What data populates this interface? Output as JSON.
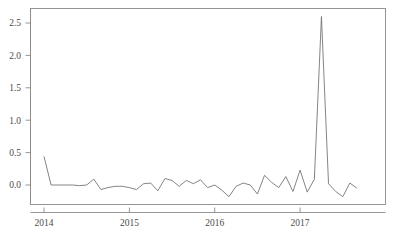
{
  "chart_data": {
    "type": "line",
    "title": "",
    "subtitle": "",
    "xlabel": "",
    "ylabel": "",
    "grid": false,
    "legend": null,
    "xlim": [
      2014.0,
      2017.75
    ],
    "ylim": [
      -0.32,
      2.72
    ],
    "x_ticks": [
      2014,
      2015,
      2016,
      2017
    ],
    "x_tick_labels": [
      "2014",
      "2015",
      "2016",
      "2017"
    ],
    "y_ticks": [
      0.0,
      0.5,
      1.0,
      1.5,
      2.0,
      2.5
    ],
    "y_tick_labels": [
      "0.0",
      "0.5",
      "1.0",
      "1.5",
      "2.0",
      "2.5"
    ],
    "series": [
      {
        "name": "series-1",
        "color": "#6e6e6e",
        "x": [
          2014.0,
          2014.083,
          2014.167,
          2014.25,
          2014.333,
          2014.417,
          2014.5,
          2014.583,
          2014.667,
          2014.75,
          2014.833,
          2014.917,
          2015.0,
          2015.083,
          2015.167,
          2015.25,
          2015.333,
          2015.417,
          2015.5,
          2015.583,
          2015.667,
          2015.75,
          2015.833,
          2015.917,
          2016.0,
          2016.083,
          2016.167,
          2016.25,
          2016.333,
          2016.417,
          2016.5,
          2016.583,
          2016.667,
          2016.75,
          2016.833,
          2016.917,
          2017.0,
          2017.083,
          2017.167,
          2017.25,
          2017.333,
          2017.417,
          2017.5,
          2017.583,
          2017.667
        ],
        "y": [
          0.44,
          0.0,
          0.0,
          0.0,
          0.0,
          -0.01,
          0.0,
          0.09,
          -0.07,
          -0.04,
          -0.02,
          -0.02,
          -0.04,
          -0.07,
          0.02,
          0.03,
          -0.09,
          0.1,
          0.07,
          -0.02,
          0.07,
          0.02,
          0.08,
          -0.04,
          0.0,
          -0.08,
          -0.18,
          -0.02,
          0.03,
          0.0,
          -0.14,
          0.15,
          0.04,
          -0.04,
          0.13,
          -0.1,
          0.23,
          -0.11,
          0.09,
          2.6,
          0.02,
          -0.1,
          -0.18,
          0.03,
          -0.05
        ]
      }
    ],
    "peak": {
      "x": 2017.0,
      "y": 2.6
    }
  },
  "figure": {
    "background_color": "#ffffff",
    "axis_color": "#8b8b8b",
    "line_color": "#6e6e6e",
    "tick_label_color": "#4a4a4a"
  }
}
